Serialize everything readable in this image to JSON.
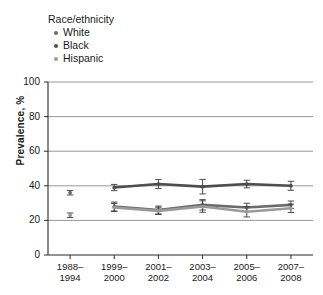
{
  "figure": {
    "width": 323,
    "height": 295,
    "background": "#ffffff"
  },
  "legend": {
    "title": "Race/ethnicity",
    "position": "top-left",
    "items": [
      {
        "label": "White",
        "color": "#6b6b6b",
        "marker": "circle"
      },
      {
        "label": "Black",
        "color": "#4d4d4d",
        "marker": "circle"
      },
      {
        "label": "Hispanic",
        "color": "#9a9a9a",
        "marker": "circle"
      }
    ]
  },
  "axes": {
    "ylabel": "Prevalence, %",
    "yticks": [
      "0",
      "20",
      "40",
      "60",
      "80",
      "100"
    ],
    "xticks": [
      {
        "line1": "1988–",
        "line2": "1994"
      },
      {
        "line1": "1999–",
        "line2": "2000"
      },
      {
        "line1": "2001–",
        "line2": "2002"
      },
      {
        "line1": "2003–",
        "line2": "2004"
      },
      {
        "line1": "2005–",
        "line2": "2006"
      },
      {
        "line1": "2007–",
        "line2": "2008"
      }
    ]
  },
  "chart_data": {
    "type": "line",
    "title": "",
    "xlabel": "",
    "ylabel": "Prevalence, %",
    "ylim": [
      0,
      100
    ],
    "yticks": [
      0,
      20,
      40,
      60,
      80,
      100
    ],
    "grid": "horizontal",
    "legend_position": "top-left",
    "legend_title": "Race/ethnicity",
    "categories": [
      "1988–1994",
      "1999–2000",
      "2001–2002",
      "2003–2004",
      "2005–2006",
      "2007–2008"
    ],
    "series": [
      {
        "name": "White",
        "color": "#6b6b6b",
        "values": [
          36.0,
          28.0,
          26.0,
          29.0,
          27.5,
          29.0
        ],
        "errors": [
          1.3,
          2.6,
          2.3,
          3.0,
          2.4,
          2.2
        ],
        "connected_from_index": 1
      },
      {
        "name": "Black",
        "color": "#4d4d4d",
        "values": [
          null,
          39.0,
          41.0,
          39.5,
          41.0,
          40.0
        ],
        "errors": [
          null,
          1.8,
          2.6,
          4.2,
          2.2,
          2.6
        ],
        "connected_from_index": 1
      },
      {
        "name": "Hispanic",
        "color": "#9a9a9a",
        "values": [
          23.0,
          27.5,
          25.5,
          28.0,
          25.0,
          27.0
        ],
        "errors": [
          1.3,
          2.3,
          2.1,
          3.3,
          3.0,
          2.4
        ],
        "connected_from_index": 1
      }
    ]
  }
}
